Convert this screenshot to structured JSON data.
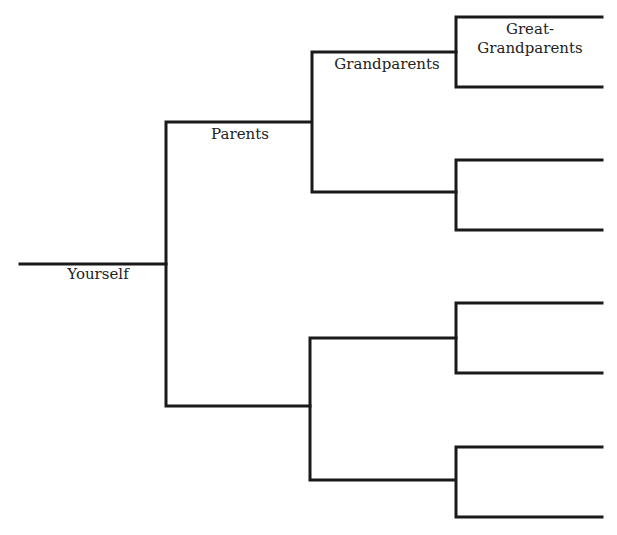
{
  "diagram": {
    "type": "family-tree",
    "line_color": "#1a1a1a",
    "labels": {
      "self": "Yourself",
      "parents": "Parents",
      "grandparents": "Grandparents",
      "great_grandparents_line1": "Great-",
      "great_grandparents_line2": "Grandparents"
    },
    "generations": [
      {
        "name": "Yourself",
        "count": 1
      },
      {
        "name": "Parents",
        "count": 2
      },
      {
        "name": "Grandparents",
        "count": 4
      },
      {
        "name": "Great-Grandparents",
        "count": 8
      }
    ]
  }
}
